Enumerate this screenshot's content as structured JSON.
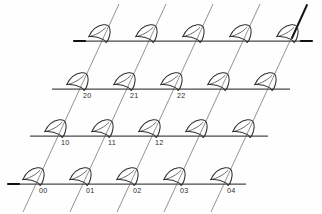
{
  "figure": {
    "background_color": "#fefefe",
    "line_color": "#4a4a4a",
    "diagonal_color": "#8d8d8d",
    "accent_color": "#111111",
    "glyph_color": "#2f2f2f",
    "label_color": "#2b2b2b"
  },
  "lattice": {
    "rows": 4,
    "columns": 5,
    "row_spacing": 47,
    "column_spacing": 47,
    "shear_per_row": 22,
    "description": "Oblique (sheared) lattice: 5 horizontal basis lines crossed by 5 diagonal basis lines, with a fan/sector glyph placed at every intersection node."
  },
  "horizontal_lines": [
    {
      "index": 0,
      "x1": 74,
      "y1": 41,
      "x2": 312,
      "y2": 41,
      "has_left_tick": true
    },
    {
      "index": 1,
      "x1": 52,
      "y1": 89,
      "x2": 290,
      "y2": 89,
      "has_left_tick": false
    },
    {
      "index": 2,
      "x1": 30,
      "y1": 136,
      "x2": 268,
      "y2": 136,
      "has_left_tick": false
    },
    {
      "index": 3,
      "x1": 8,
      "y1": 184,
      "x2": 246,
      "y2": 184,
      "has_left_tick": true
    }
  ],
  "diagonal_lines": [
    {
      "index": 0,
      "x1": 119,
      "y1": 4,
      "x2": 23,
      "y2": 212,
      "emphasis": "normal"
    },
    {
      "index": 1,
      "x1": 166,
      "y1": 4,
      "x2": 70,
      "y2": 212,
      "emphasis": "normal"
    },
    {
      "index": 2,
      "x1": 213,
      "y1": 4,
      "x2": 117,
      "y2": 212,
      "emphasis": "normal"
    },
    {
      "index": 3,
      "x1": 260,
      "y1": 4,
      "x2": 164,
      "y2": 212,
      "emphasis": "normal"
    },
    {
      "index": 4,
      "x1": 307,
      "y1": 4,
      "x2": 211,
      "y2": 212,
      "emphasis": "strong-top"
    }
  ],
  "nodes": [
    {
      "row": 0,
      "col": 0,
      "x": 101,
      "y": 41,
      "label": ""
    },
    {
      "row": 0,
      "col": 1,
      "x": 148,
      "y": 41,
      "label": ""
    },
    {
      "row": 0,
      "col": 2,
      "x": 195,
      "y": 41,
      "label": ""
    },
    {
      "row": 0,
      "col": 3,
      "x": 242,
      "y": 41,
      "label": ""
    },
    {
      "row": 0,
      "col": 4,
      "x": 289,
      "y": 41,
      "label": ""
    },
    {
      "row": 1,
      "col": 0,
      "x": 79,
      "y": 89,
      "label": "20"
    },
    {
      "row": 1,
      "col": 1,
      "x": 126,
      "y": 89,
      "label": "21"
    },
    {
      "row": 1,
      "col": 2,
      "x": 173,
      "y": 89,
      "label": "22"
    },
    {
      "row": 1,
      "col": 3,
      "x": 220,
      "y": 89,
      "label": ""
    },
    {
      "row": 1,
      "col": 4,
      "x": 267,
      "y": 89,
      "label": ""
    },
    {
      "row": 2,
      "col": 0,
      "x": 57,
      "y": 136,
      "label": "10"
    },
    {
      "row": 2,
      "col": 1,
      "x": 104,
      "y": 136,
      "label": "11"
    },
    {
      "row": 2,
      "col": 2,
      "x": 151,
      "y": 136,
      "label": "12"
    },
    {
      "row": 2,
      "col": 3,
      "x": 198,
      "y": 136,
      "label": ""
    },
    {
      "row": 2,
      "col": 4,
      "x": 245,
      "y": 136,
      "label": ""
    },
    {
      "row": 3,
      "col": 0,
      "x": 35,
      "y": 184,
      "label": "00"
    },
    {
      "row": 3,
      "col": 1,
      "x": 82,
      "y": 184,
      "label": "01"
    },
    {
      "row": 3,
      "col": 2,
      "x": 129,
      "y": 184,
      "label": "02"
    },
    {
      "row": 3,
      "col": 3,
      "x": 176,
      "y": 184,
      "label": "03"
    },
    {
      "row": 3,
      "col": 4,
      "x": 223,
      "y": 184,
      "label": "04"
    }
  ],
  "labels": {
    "visible": [
      "20",
      "21",
      "22",
      "10",
      "11",
      "12",
      "00",
      "01",
      "02",
      "03",
      "04"
    ],
    "offset_x": 4,
    "offset_y": 9,
    "font_size": 7.2
  },
  "glyph": {
    "name": "fan-sector-marker",
    "count": 20,
    "offset_x": -13,
    "offset_y": -17,
    "description": "Small fan / circular-sector (quarter-shell) outline opening toward the lower-left, drawn above-left of each lattice node."
  }
}
